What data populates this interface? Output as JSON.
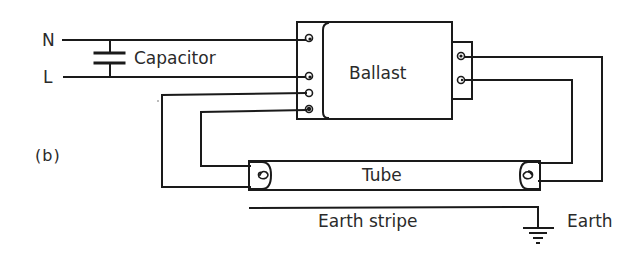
{
  "diagram": {
    "panel_label": "(b)",
    "supply": {
      "neutral_label": "N",
      "live_label": "L"
    },
    "components": {
      "capacitor": {
        "label": "Capacitor",
        "icon": "capacitor-icon"
      },
      "ballast": {
        "label": "Ballast",
        "left_terminals": 4,
        "right_terminals": 2
      },
      "tube": {
        "label": "Tube",
        "icon": "filament-icon"
      },
      "earth_stripe": {
        "label": "Earth stripe"
      },
      "earth": {
        "label": "Earth",
        "icon": "ground-icon"
      }
    },
    "colors": {
      "line": "#1a1a1a",
      "text": "#2a2a2a",
      "background": "#ffffff"
    }
  }
}
